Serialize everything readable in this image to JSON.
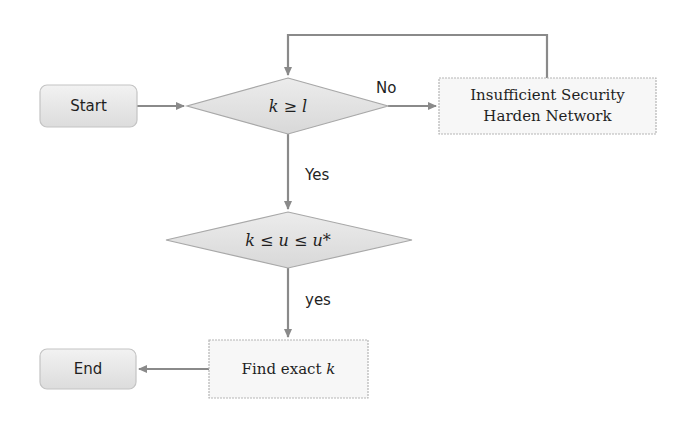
{
  "diagram": {
    "type": "flowchart",
    "colors": {
      "edge": "#8a8a8a",
      "node_border": "#b5b5b5",
      "rounded_fill": "#e6e6e6",
      "diamond_fill": "#e2e2e2",
      "rect_fill": "#f7f7f7",
      "text": "#1f1f1f"
    },
    "nodes": {
      "start": {
        "label": "Start",
        "shape": "rounded-rect"
      },
      "decision_k_ge_l": {
        "label": "k ≥ l",
        "shape": "diamond"
      },
      "insufficient": {
        "line1": "Insufficient Security",
        "line2": "Harden Network",
        "shape": "rect"
      },
      "decision_k_le_u": {
        "label": "k ≤ u ≤ u*",
        "shape": "diamond"
      },
      "find_exact": {
        "label_prefix": "Find exact ",
        "label_var": "k",
        "shape": "rect"
      },
      "end": {
        "label": "End",
        "shape": "rounded-rect"
      }
    },
    "edges": [
      {
        "from": "start",
        "to": "decision_k_ge_l",
        "label": ""
      },
      {
        "from": "decision_k_ge_l",
        "to": "insufficient",
        "label": "No"
      },
      {
        "from": "insufficient",
        "to": "decision_k_ge_l",
        "label": ""
      },
      {
        "from": "decision_k_ge_l",
        "to": "decision_k_le_u",
        "label": "Yes"
      },
      {
        "from": "decision_k_le_u",
        "to": "find_exact",
        "label": "yes"
      },
      {
        "from": "find_exact",
        "to": "end",
        "label": ""
      }
    ],
    "edge_labels": {
      "no": "No",
      "yes_upper": "Yes",
      "yes_lower": "yes"
    }
  }
}
